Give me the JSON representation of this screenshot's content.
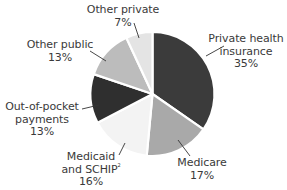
{
  "chart_data": {
    "type": "pie",
    "title": "",
    "start_angle_deg": 0,
    "direction": "clockwise",
    "slices": [
      {
        "label": "Private health insurance",
        "value": 35,
        "value_label": "35%",
        "color": "#3b3b3b"
      },
      {
        "label": "Medicare",
        "value": 17,
        "value_label": "17%",
        "color": "#a9a9a9"
      },
      {
        "label": "Medicaid and SCHIP",
        "footnote": "2",
        "value": 16,
        "value_label": "16%",
        "color": "#f3f3f3"
      },
      {
        "label": "Out-of-pocket payments",
        "value": 13,
        "value_label": "13%",
        "color": "#2f2f2f"
      },
      {
        "label": "Other public",
        "value": 13,
        "value_label": "13%",
        "color": "#bcbcbc"
      },
      {
        "label": "Other private",
        "value": 7,
        "value_label": "7%",
        "color": "#e4e4e4"
      }
    ],
    "legend": "none (direct labels with leader lines)"
  },
  "labels": {
    "private_health": {
      "line1": "Private health",
      "line2": "insurance",
      "pct": "35%"
    },
    "medicare": {
      "line1": "Medicare",
      "pct": "17%"
    },
    "medicaid": {
      "line1": "Medicaid",
      "line2": "and SCHIP",
      "sup": "2",
      "pct": "16%"
    },
    "out_of_pocket": {
      "line1": "Out-of-pocket",
      "line2": "payments",
      "pct": "13%"
    },
    "other_public": {
      "line1": "Other public",
      "pct": "13%"
    },
    "other_private": {
      "line1": "Other private",
      "pct": "7%"
    }
  }
}
